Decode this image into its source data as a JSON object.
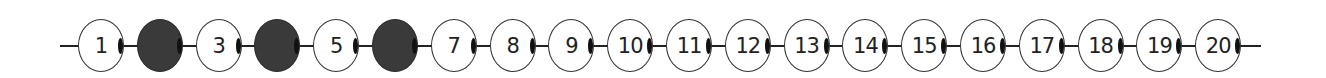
{
  "number_line": {
    "start_x": 101,
    "pitch": 58.8,
    "colors": {
      "filled": "#3a3a3a",
      "empty": "#ffffff",
      "line": "#222222"
    },
    "beads": [
      {
        "label": "1",
        "filled": false
      },
      {
        "label": "",
        "filled": true
      },
      {
        "label": "3",
        "filled": false
      },
      {
        "label": "",
        "filled": true
      },
      {
        "label": "5",
        "filled": false
      },
      {
        "label": "",
        "filled": true
      },
      {
        "label": "7",
        "filled": false
      },
      {
        "label": "8",
        "filled": false
      },
      {
        "label": "9",
        "filled": false
      },
      {
        "label": "10",
        "filled": false
      },
      {
        "label": "11",
        "filled": false
      },
      {
        "label": "12",
        "filled": false
      },
      {
        "label": "13",
        "filled": false
      },
      {
        "label": "14",
        "filled": false
      },
      {
        "label": "15",
        "filled": false
      },
      {
        "label": "16",
        "filled": false
      },
      {
        "label": "17",
        "filled": false
      },
      {
        "label": "18",
        "filled": false
      },
      {
        "label": "19",
        "filled": false
      },
      {
        "label": "20",
        "filled": false
      }
    ]
  }
}
